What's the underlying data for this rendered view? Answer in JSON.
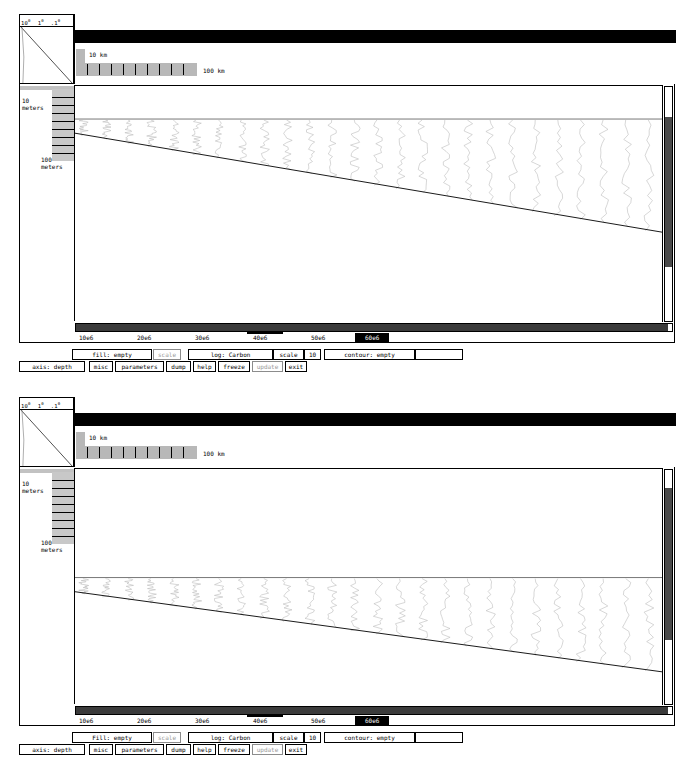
{
  "app": {
    "title": "Basin Stratigraphy Viewer",
    "panel_count": 2
  },
  "legend": {
    "tick_a": "10",
    "tick_a_exp": "0",
    "tick_b": "1",
    "tick_b_exp": "0",
    "tick_c": ".1",
    "tick_c_exp": "0"
  },
  "scale_bars": {
    "small_label": "10 km",
    "large_label": "100 km"
  },
  "depth_axis": {
    "label_shallow": "10\nmeters",
    "label_shallow_line1": "10",
    "label_shallow_line2": "meters",
    "label_deep_line1": "100",
    "label_deep_line2": "meters"
  },
  "panels": [
    {
      "id": "top",
      "xaxis": {
        "ticks": [
          "10e6",
          "20e6",
          "30e6",
          "40e6",
          "50e6"
        ],
        "selected_tick": "60e6"
      },
      "controls_row1": {
        "fill_label": "fill:  empty",
        "scale_label": "scale",
        "log_label": "log:  Carbon",
        "scale2_label": "scale",
        "scale2_value": "10",
        "contour_label": "contour:  empty",
        "blank_label": ""
      },
      "controls_row2": {
        "axis_label": "axis: depth",
        "misc_label": "misc",
        "parameters_label": "parameters",
        "dump_label": "dump",
        "help_label": "help",
        "freeze_label": "freeze",
        "update_label": "update",
        "exit_label": "exit"
      }
    },
    {
      "id": "bottom",
      "xaxis": {
        "ticks": [
          "10e6",
          "20e6",
          "30e6",
          "40e6",
          "50e6"
        ],
        "selected_tick": "60e6"
      },
      "controls_row1": {
        "fill_label": "Fill:  empty",
        "scale_label": "scale",
        "log_label": "log:  Carbon",
        "scale2_label": "scale",
        "scale2_value": "10",
        "contour_label": "contour:  empty",
        "blank_label": ""
      },
      "controls_row2": {
        "axis_label": "axis: depth",
        "misc_label": "misc",
        "parameters_label": "parameters",
        "dump_label": "dump",
        "help_label": "help",
        "freeze_label": "freeze",
        "update_label": "update",
        "exit_label": "exit"
      }
    }
  ],
  "colors": {
    "titlebar": "#000000",
    "scalebar_fill": "#b8b8b8",
    "depth_axis_fill": "#c8c8c8",
    "scroll_thumb_v": "#4a4a4a",
    "scroll_thumb_h": "#3b3b3b",
    "selected_tick_bg": "#000000",
    "selected_tick_fg": "#ffffff",
    "disabled_text": "#9a9a9a"
  },
  "chart_data": {
    "type": "line",
    "title": "",
    "xlabel": "",
    "ylabel": "depth",
    "xtick_labels": [
      "10e6",
      "20e6",
      "30e6",
      "40e6",
      "50e6",
      "60e6"
    ],
    "xlim": [
      0,
      65000000
    ],
    "ytick_labels": [
      "10 meters",
      "100 meters"
    ],
    "series_note": "repeated vertical wiggle traces (carbon log) across basin width",
    "trace_count_top": 26,
    "trace_count_bottom": 26,
    "basement_line_top": {
      "x0": 0,
      "y0": 0.2,
      "x1": 1.0,
      "y1": 0.62
    },
    "basement_line_bottom": {
      "x0": 0,
      "y0": 0.52,
      "x1": 1.0,
      "y1": 0.86
    },
    "sediment_top_line_top": 0.14,
    "sediment_top_line_bottom": 0.46
  }
}
